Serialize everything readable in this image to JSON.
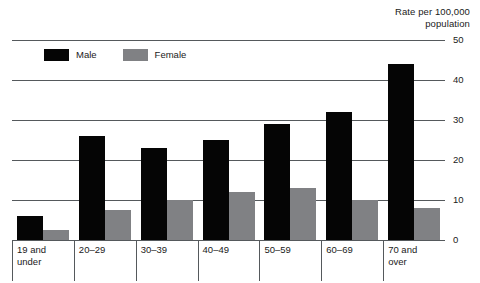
{
  "chart_data": {
    "type": "bar",
    "title": "Rate per 100,000 population",
    "title_lines": [
      "Rate per 100,000",
      "population"
    ],
    "xlabel": "",
    "ylabel": "Rate per 100,000 population",
    "ylim": [
      0,
      50
    ],
    "ytick_labels": [
      "50",
      "40",
      "30",
      "20",
      "10",
      "0"
    ],
    "yticks": [
      50,
      40,
      30,
      20,
      10,
      0
    ],
    "grid": true,
    "legend_position": "top-left-inside",
    "categories": [
      "19 and\nunder",
      "20–29",
      "30–39",
      "40–49",
      "50–59",
      "60–69",
      "70 and\nover"
    ],
    "series": [
      {
        "name": "Male",
        "color": "#050505",
        "values": [
          6,
          26,
          23,
          25,
          29,
          32,
          44
        ]
      },
      {
        "name": "Female",
        "color": "#808184",
        "values": [
          2.5,
          7.5,
          10,
          12,
          13,
          10,
          8
        ]
      }
    ]
  },
  "legend": {
    "items": [
      {
        "label": "Male",
        "swatch": "male"
      },
      {
        "label": "Female",
        "swatch": "female"
      }
    ]
  },
  "colors": {
    "male": "#050505",
    "female": "#808184",
    "gridline": "#55595c",
    "text": "#1a1a1a",
    "background": "#ffffff"
  }
}
